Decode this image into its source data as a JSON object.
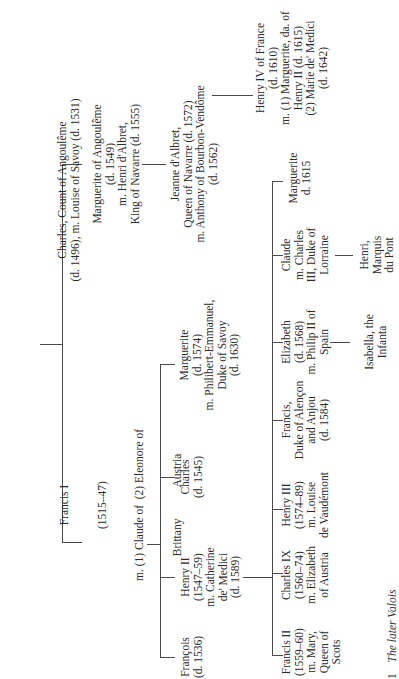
{
  "caption": {
    "number": "1",
    "title": "The later Valois"
  },
  "nodes": {
    "charles_angouleme": [
      "Charles, Count of Angoulême",
      "(d. 1496), m. Louise of Savoy (d. 1531)"
    ],
    "marguerite_angouleme": [
      "Marguerite of Angoulême",
      "(d. 1549)",
      "m. Henri d'Albret,",
      "King of Navarre (d. 1555)"
    ],
    "jeanne_albret": [
      "Jeanne d'Albret,",
      "Queen of Navarre (d. 1572)",
      "m. Anthony of Bourbon-Vendôme",
      "(d. 1562)"
    ],
    "henry_iv": [
      "Henry IV of France",
      "(d. 1610)",
      "m. (1) Marguerite, da. of",
      "Henry II (d. 1615)",
      "(2) Marie de' Medici",
      "(d. 1642)"
    ],
    "francis_i": [
      "Francis I",
      "(1515–47)",
      "m. (1) Claude of  (2) Eleonore of",
      "Brittany           Austria"
    ],
    "francois": [
      "François",
      "(d. 1536)"
    ],
    "henry_ii": [
      "Henry II",
      "(1547–59)",
      "m. Catherine",
      "de' Medici",
      "(d. 1589)"
    ],
    "charles_1545": [
      "Charles",
      "(d. 1545)"
    ],
    "marguerite_1574": [
      "Marguerite",
      "(d. 1574)",
      "m. Philibert-Emmanuel,",
      "Duke of Savoy",
      "(d. 1630)"
    ],
    "francis_ii": [
      "Francis II",
      "(1559–60)",
      "m. Mary,",
      "Queen of",
      "Scots"
    ],
    "charles_ix": [
      "Charles IX",
      "(1560–74)",
      "m. Elizabeth",
      "of Austria"
    ],
    "henry_iii": [
      "Henry III",
      "(1574–89)",
      "m. Louise",
      "de Vaudémont"
    ],
    "francis_alencon": [
      "Francis,",
      "Duke of Alençon",
      "and Anjou",
      "(d. 1584)"
    ],
    "elizabeth": [
      "Elizabeth",
      "(d. 1568)",
      "m. Philip II of",
      "Spain"
    ],
    "claude": [
      "Claude",
      "m. Charles",
      "III, Duke of",
      "Lorraine"
    ],
    "marguerite_1615": [
      "Marguerite",
      "d. 1615"
    ],
    "isabella": [
      "Isabella, the",
      "Infanta"
    ],
    "henri_marquis": [
      "Henri,",
      "Marquis",
      "du Pont"
    ]
  },
  "colors": {
    "line": "#4a4a4a",
    "text": "#2a2a2a",
    "background": "#ffffff"
  }
}
